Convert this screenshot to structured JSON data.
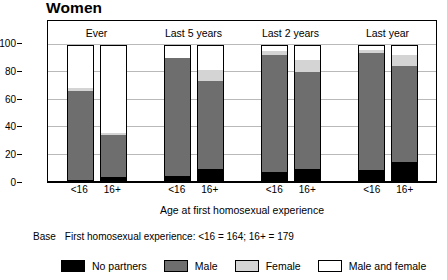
{
  "chart_data": {
    "type": "bar",
    "title": "Women",
    "xlabel": "Age at first homosexual experience",
    "ylabel": "Percentage",
    "ylim": [
      0,
      100
    ],
    "yticks": [
      0,
      20,
      40,
      60,
      80,
      100
    ],
    "grid": true,
    "stacked": true,
    "legend_position": "bottom",
    "group_labels": [
      "Ever",
      "Last 5 years",
      "Last 2 years",
      "Last year"
    ],
    "categories": [
      "Ever <16",
      "Ever 16+",
      "Last 5 years <16",
      "Last 5 years 16+",
      "Last 2 years <16",
      "Last 2 years 16+",
      "Last year <16",
      "Last year 16+"
    ],
    "tick_labels": [
      "<16",
      "16+",
      "<16",
      "16+",
      "<16",
      "16+",
      "<16",
      "16+"
    ],
    "series": [
      {
        "name": "No partners",
        "color": "#000000",
        "values": [
          1,
          3,
          4,
          9,
          7,
          9,
          8,
          14
        ]
      },
      {
        "name": "Male",
        "color": "#6e6e6e",
        "values": [
          66,
          31,
          87,
          65,
          86,
          72,
          86.5,
          71
        ]
      },
      {
        "name": "Female",
        "color": "#d4d4d4",
        "values": [
          2,
          1.5,
          0.5,
          8,
          3.5,
          9,
          2.5,
          8
        ]
      },
      {
        "name": "Male and female",
        "color": "#ffffff",
        "values": [
          31,
          64.5,
          8.5,
          18,
          3.5,
          10,
          3,
          7
        ]
      }
    ],
    "annotations": {
      "base_word": "Base",
      "base_text": "First homosexual experience: <16 = 164; 16+ = 179"
    }
  },
  "axes": {
    "y_tick_labels": [
      "0",
      "20",
      "40",
      "60",
      "80",
      "100"
    ]
  },
  "legend": {
    "items": [
      {
        "label": "No partners",
        "swatch": "#000000"
      },
      {
        "label": "Male",
        "swatch": "#6e6e6e"
      },
      {
        "label": "Female",
        "swatch": "#d4d4d4"
      },
      {
        "label": "Male and female",
        "swatch": "#ffffff"
      }
    ]
  }
}
